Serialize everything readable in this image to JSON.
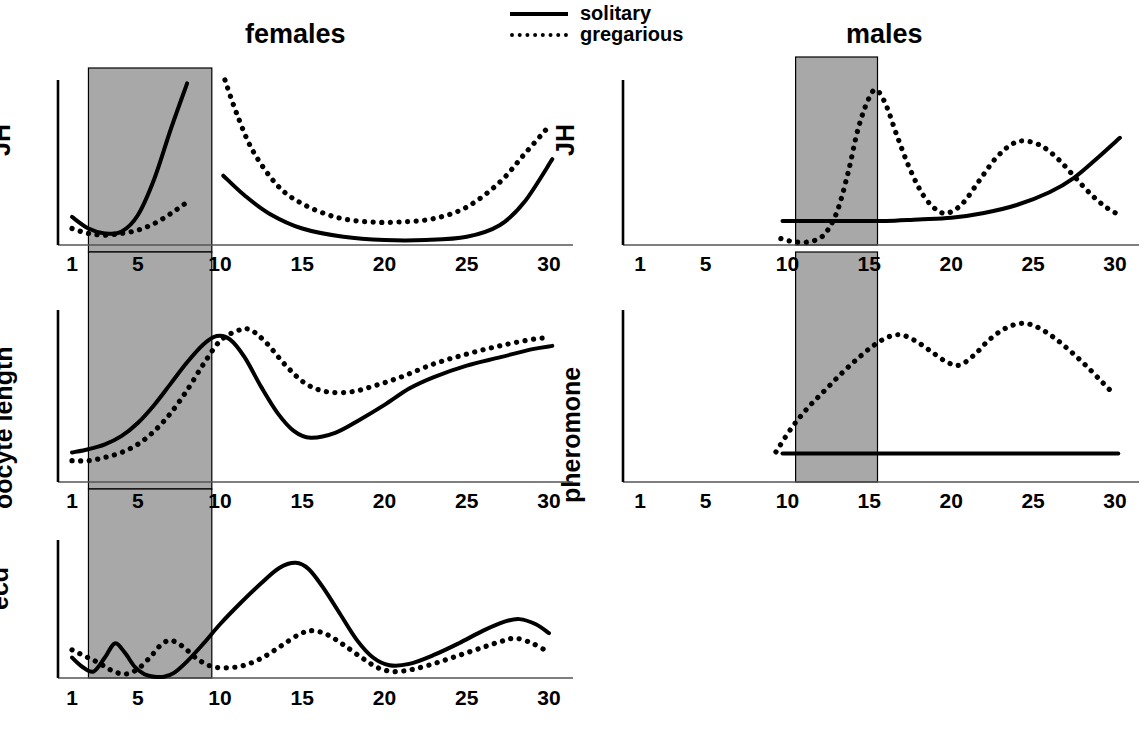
{
  "figure": {
    "panel_titles": {
      "left": "females",
      "right": "males"
    },
    "legend": {
      "position": "top-center",
      "items": [
        {
          "label": "solitary",
          "style": "solid",
          "swatch": "solid-line-icon"
        },
        {
          "label": "gregarious",
          "style": "dotted",
          "swatch": "dotted-line-icon"
        }
      ]
    },
    "axis_tick_labels": [
      "1",
      "5",
      "10",
      "15",
      "20",
      "25",
      "30"
    ],
    "shading_color": "#a8a8a8",
    "line_color": "#000000"
  },
  "chart_data": [
    {
      "id": "females-jh",
      "type": "line",
      "title": "females",
      "ylabel": "JH",
      "xlabel": "",
      "xlim": [
        1,
        30
      ],
      "xticks": [
        1,
        5,
        10,
        15,
        20,
        25,
        30
      ],
      "ylim": [
        0,
        1
      ],
      "grid": false,
      "shaded_region": {
        "x0": 2.0,
        "x1": 9.5
      },
      "series": [
        {
          "name": "solitary",
          "style": "solid",
          "segments": [
            {
              "x": [
                1.0,
                2.0,
                3.0,
                4.0,
                5.0,
                6.0,
                7.0,
                8.0
              ],
              "y": [
                0.17,
                0.1,
                0.07,
                0.08,
                0.18,
                0.4,
                0.7,
                0.98
              ]
            },
            {
              "x": [
                10.2,
                11.5,
                13.0,
                15.0,
                17.5,
                20.0,
                22.5,
                25.0,
                27.0,
                28.5,
                30.2
              ],
              "y": [
                0.42,
                0.3,
                0.19,
                0.1,
                0.05,
                0.03,
                0.03,
                0.05,
                0.12,
                0.26,
                0.52
              ]
            }
          ]
        },
        {
          "name": "gregarious",
          "style": "dotted",
          "segments": [
            {
              "x": [
                1.0,
                2.0,
                3.0,
                4.0,
                5.0,
                6.0,
                7.0,
                8.0
              ],
              "y": [
                0.1,
                0.07,
                0.06,
                0.07,
                0.09,
                0.13,
                0.19,
                0.26
              ]
            },
            {
              "x": [
                10.3,
                11.0,
                12.0,
                13.5,
                15.0,
                17.0,
                19.0,
                21.0,
                23.0,
                25.0,
                27.0,
                28.5,
                30.0
              ],
              "y": [
                1.0,
                0.8,
                0.57,
                0.36,
                0.25,
                0.17,
                0.14,
                0.14,
                0.16,
                0.23,
                0.38,
                0.55,
                0.72
              ]
            }
          ]
        }
      ]
    },
    {
      "id": "females-oocyte-length",
      "type": "line",
      "title": "females",
      "ylabel": "oocyte length",
      "xlabel": "",
      "xlim": [
        1,
        30
      ],
      "xticks": [
        1,
        5,
        10,
        15,
        20,
        25,
        30
      ],
      "ylim": [
        0,
        1
      ],
      "grid": false,
      "shaded_region": {
        "x0": 2.0,
        "x1": 9.5
      },
      "series": [
        {
          "name": "solitary",
          "style": "solid",
          "segments": [
            {
              "x": [
                1.0,
                2.0,
                3.0,
                4.0,
                5.0,
                6.0,
                7.0,
                8.0,
                9.0,
                9.8,
                10.6,
                11.5,
                12.5,
                13.5,
                14.5,
                15.5,
                17.0,
                18.5,
                20.0,
                21.5,
                23.0,
                25.0,
                27.0,
                29.0,
                30.2
              ],
              "y": [
                0.18,
                0.2,
                0.23,
                0.28,
                0.36,
                0.47,
                0.6,
                0.73,
                0.84,
                0.89,
                0.87,
                0.76,
                0.58,
                0.42,
                0.31,
                0.27,
                0.3,
                0.38,
                0.47,
                0.57,
                0.64,
                0.71,
                0.76,
                0.81,
                0.83
              ]
            }
          ]
        },
        {
          "name": "gregarious",
          "style": "dotted",
          "segments": [
            {
              "x": [
                1.0,
                2.0,
                3.0,
                4.0,
                5.0,
                6.0,
                7.0,
                8.0,
                9.0,
                10.0,
                11.0,
                11.8,
                12.8,
                14.0,
                15.2,
                16.5,
                18.0,
                19.5,
                21.0,
                23.0,
                25.0,
                27.0,
                29.0,
                30.0
              ],
              "y": [
                0.13,
                0.13,
                0.15,
                0.18,
                0.23,
                0.31,
                0.42,
                0.56,
                0.72,
                0.86,
                0.92,
                0.93,
                0.85,
                0.71,
                0.6,
                0.55,
                0.55,
                0.59,
                0.64,
                0.72,
                0.78,
                0.83,
                0.87,
                0.88
              ]
            }
          ]
        }
      ]
    },
    {
      "id": "females-ecd",
      "type": "line",
      "title": "females",
      "ylabel": "ecd",
      "xlabel": "",
      "xlim": [
        1,
        30
      ],
      "xticks": [
        1,
        5,
        10,
        15,
        20,
        25,
        30
      ],
      "ylim": [
        0,
        1
      ],
      "grid": false,
      "shaded_region": {
        "x0": 2.0,
        "x1": 9.5
      },
      "series": [
        {
          "name": "solitary",
          "style": "solid",
          "segments": [
            {
              "x": [
                1.0,
                1.6,
                2.3,
                3.0,
                3.6,
                4.2,
                4.8,
                5.4,
                6.0,
                6.6,
                7.2,
                8.0,
                9.0,
                10.0,
                11.2,
                12.5,
                13.6,
                14.6,
                15.4,
                16.3,
                17.3,
                18.3,
                19.3,
                20.3,
                21.5,
                23.0,
                24.5,
                26.0,
                27.3,
                28.2,
                29.2,
                30.0
              ],
              "y": [
                0.16,
                0.09,
                0.05,
                0.16,
                0.27,
                0.2,
                0.09,
                0.03,
                0.01,
                0.01,
                0.04,
                0.13,
                0.27,
                0.42,
                0.58,
                0.74,
                0.86,
                0.9,
                0.85,
                0.7,
                0.5,
                0.3,
                0.16,
                0.1,
                0.11,
                0.18,
                0.27,
                0.37,
                0.44,
                0.46,
                0.42,
                0.35
              ]
            }
          ]
        },
        {
          "name": "gregarious",
          "style": "dotted",
          "segments": [
            {
              "x": [
                1.0,
                1.8,
                2.6,
                3.4,
                4.2,
                5.0,
                5.8,
                6.5,
                7.1,
                7.8,
                8.6,
                9.5,
                10.5,
                11.5,
                12.6,
                13.7,
                14.8,
                15.6,
                16.5,
                17.5,
                18.6,
                19.6,
                20.6,
                21.8,
                23.2,
                24.6,
                26.0,
                27.2,
                28.0,
                29.0,
                30.0
              ],
              "y": [
                0.22,
                0.17,
                0.12,
                0.06,
                0.03,
                0.07,
                0.17,
                0.27,
                0.29,
                0.24,
                0.15,
                0.09,
                0.08,
                0.1,
                0.16,
                0.25,
                0.34,
                0.37,
                0.34,
                0.26,
                0.16,
                0.08,
                0.05,
                0.07,
                0.12,
                0.18,
                0.24,
                0.29,
                0.31,
                0.27,
                0.2
              ]
            }
          ]
        }
      ]
    },
    {
      "id": "males-jh",
      "type": "line",
      "title": "males",
      "ylabel": "JH",
      "xlabel": "",
      "xlim": [
        1,
        30
      ],
      "xticks": [
        1,
        5,
        10,
        15,
        20,
        25,
        30
      ],
      "ylim": [
        0,
        1
      ],
      "grid": false,
      "shaded_region": {
        "x0": 10.5,
        "x1": 15.5
      },
      "series": [
        {
          "name": "solitary",
          "style": "solid",
          "segments": [
            {
              "x": [
                9.7,
                12.0,
                14.0,
                16.0,
                18.0,
                20.0,
                22.0,
                24.0,
                26.0,
                27.5,
                29.0,
                30.3
              ],
              "y": [
                0.15,
                0.15,
                0.15,
                0.15,
                0.16,
                0.17,
                0.2,
                0.25,
                0.33,
                0.42,
                0.55,
                0.67
              ]
            }
          ]
        },
        {
          "name": "gregarious",
          "style": "dotted",
          "segments": [
            {
              "x": [
                9.6,
                10.4,
                11.3,
                12.2,
                13.0,
                13.7,
                14.3,
                14.9,
                15.4,
                16.0,
                16.7,
                17.5,
                18.3,
                19.1,
                19.8,
                20.7,
                21.7,
                22.7,
                23.7,
                24.5,
                25.5,
                26.5,
                27.5,
                28.5,
                29.4,
                30.2
              ],
              "y": [
                0.04,
                0.02,
                0.02,
                0.06,
                0.2,
                0.45,
                0.72,
                0.9,
                0.97,
                0.88,
                0.68,
                0.47,
                0.31,
                0.22,
                0.2,
                0.26,
                0.4,
                0.54,
                0.63,
                0.65,
                0.62,
                0.54,
                0.43,
                0.32,
                0.24,
                0.19
              ]
            }
          ]
        }
      ]
    },
    {
      "id": "males-pheromone",
      "type": "line",
      "title": "males",
      "ylabel": "pheromone",
      "xlabel": "",
      "xlim": [
        1,
        30
      ],
      "xticks": [
        1,
        5,
        10,
        15,
        20,
        25,
        30
      ],
      "ylim": [
        0,
        1
      ],
      "grid": false,
      "shaded_region": {
        "x0": 10.5,
        "x1": 15.5
      },
      "series": [
        {
          "name": "solitary",
          "style": "solid",
          "segments": [
            {
              "x": [
                9.7,
                15.0,
                20.0,
                25.0,
                30.2
              ],
              "y": [
                0.17,
                0.17,
                0.17,
                0.17,
                0.17
              ]
            }
          ]
        },
        {
          "name": "gregarious",
          "style": "dotted",
          "segments": [
            {
              "x": [
                9.3,
                10.3,
                11.3,
                12.3,
                13.3,
                14.3,
                15.3,
                16.2,
                17.0,
                17.9,
                18.8,
                19.7,
                20.5,
                21.4,
                22.3,
                23.3,
                24.3,
                25.2,
                26.2,
                27.2,
                28.2,
                29.2,
                30.0
              ],
              "y": [
                0.18,
                0.33,
                0.45,
                0.55,
                0.65,
                0.74,
                0.82,
                0.87,
                0.88,
                0.84,
                0.78,
                0.72,
                0.7,
                0.76,
                0.85,
                0.92,
                0.95,
                0.93,
                0.87,
                0.79,
                0.7,
                0.6,
                0.52
              ]
            }
          ]
        }
      ]
    }
  ]
}
